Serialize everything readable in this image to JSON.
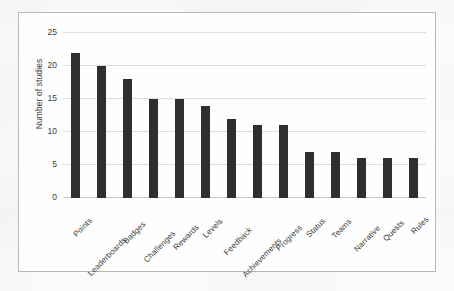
{
  "chart_data": {
    "type": "bar",
    "title": "",
    "xlabel": "",
    "ylabel": "Number of studies",
    "ylim": [
      0,
      25
    ],
    "yticks": [
      0,
      5,
      10,
      15,
      20,
      25
    ],
    "grid": true,
    "legend": false,
    "bar_color": "#2f2f2f",
    "gridline_color": "#dcdcdc",
    "frame_color": "#b9b9b9",
    "categories": [
      "Points",
      "Leaderboards",
      "Badges",
      "Challenges",
      "Rewards",
      "Levels",
      "Feedback",
      "Achievements",
      "Progress",
      "Status",
      "Teams",
      "Narrative",
      "Quests",
      "Rules"
    ],
    "values": [
      22,
      20,
      18,
      15,
      15,
      14,
      12,
      11,
      11,
      7,
      7,
      6,
      6,
      6
    ]
  }
}
